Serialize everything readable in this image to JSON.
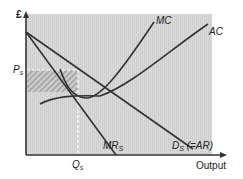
{
  "diagram": {
    "y_axis_label": "£",
    "x_axis_label": "Output",
    "curves": [
      {
        "id": "MC",
        "label": "MC"
      },
      {
        "id": "AC",
        "label": "AC"
      },
      {
        "id": "MR",
        "label": "MR",
        "subscript": "S"
      },
      {
        "id": "D",
        "label": "D",
        "subscript": "S",
        "suffix": " (=AR)"
      }
    ],
    "markers": {
      "price": {
        "label": "P",
        "subscript": "s"
      },
      "quantity": {
        "label": "Q",
        "subscript": "s"
      }
    },
    "colors": {
      "background_panel": "#d6d6d6",
      "lines": "#333333",
      "hatch": "#a0a0a0",
      "dashed": "#ffffff"
    }
  }
}
